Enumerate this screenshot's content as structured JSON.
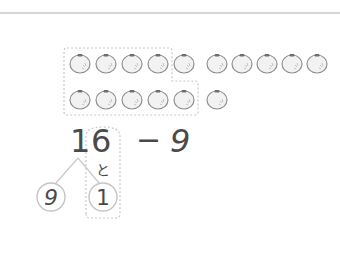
{
  "problem": {
    "minuend_tens": "1",
    "minuend_ones": "6",
    "operator": "−",
    "subtrahend": "9",
    "connector": "と",
    "split_left": "9",
    "split_right": "1"
  },
  "counters": {
    "row1_count": 10,
    "row2_count": 6,
    "grouped_count": 10,
    "item": "tomato-icon"
  },
  "colors": {
    "rule": "#d6d6d6",
    "stroke": "#bdbdbd",
    "dashed": "#c8c8c8",
    "text": "#4a4a4a",
    "tomato_fill": "#f2f2f2",
    "tomato_outline": "#8f8f8f",
    "tomato_stem": "#6e6e6e"
  }
}
